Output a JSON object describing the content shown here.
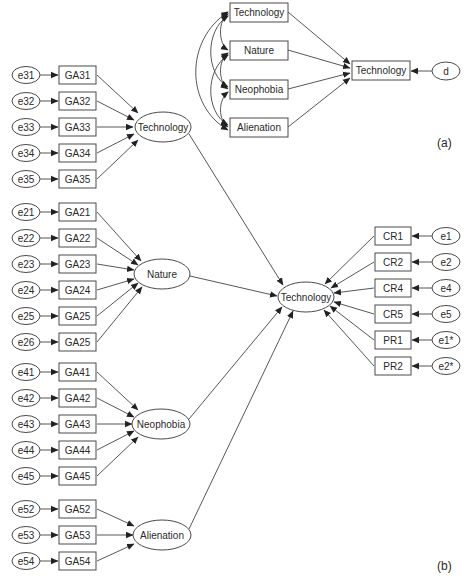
{
  "panel_a": {
    "label": "(a)",
    "predictors": [
      "Technology",
      "Nature",
      "Neophobia",
      "Alienation"
    ],
    "outcome": "Technology",
    "disturbance": "d"
  },
  "panel_b": {
    "label": "(b)",
    "latent_factors": [
      {
        "name": "Technology",
        "indicators": [
          {
            "error": "e31",
            "item": "GA31"
          },
          {
            "error": "e32",
            "item": "GA32"
          },
          {
            "error": "e33",
            "item": "GA33"
          },
          {
            "error": "e34",
            "item": "GA34"
          },
          {
            "error": "e35",
            "item": "GA35"
          }
        ]
      },
      {
        "name": "Nature",
        "indicators": [
          {
            "error": "e21",
            "item": "GA21"
          },
          {
            "error": "e22",
            "item": "GA22"
          },
          {
            "error": "e23",
            "item": "GA23"
          },
          {
            "error": "e24",
            "item": "GA24"
          },
          {
            "error": "e25",
            "item": "GA25"
          },
          {
            "error": "e26",
            "item": "GA25"
          }
        ]
      },
      {
        "name": "Neophobia",
        "indicators": [
          {
            "error": "e41",
            "item": "GA41"
          },
          {
            "error": "e42",
            "item": "GA42"
          },
          {
            "error": "e43",
            "item": "GA43"
          },
          {
            "error": "e44",
            "item": "GA44"
          },
          {
            "error": "e45",
            "item": "GA45"
          }
        ]
      },
      {
        "name": "Alienation",
        "indicators": [
          {
            "error": "e52",
            "item": "GA52"
          },
          {
            "error": "e53",
            "item": "GA53"
          },
          {
            "error": "e54",
            "item": "GA54"
          }
        ]
      }
    ],
    "outcome": {
      "name": "Technology",
      "indicators": [
        {
          "item": "CR1",
          "error": "e1"
        },
        {
          "item": "CR2",
          "error": "e2"
        },
        {
          "item": "CR4",
          "error": "e4"
        },
        {
          "item": "CR5",
          "error": "e5"
        },
        {
          "item": "PR1",
          "error": "e1*"
        },
        {
          "item": "PR2",
          "error": "e2*"
        }
      ]
    }
  }
}
